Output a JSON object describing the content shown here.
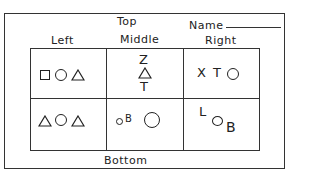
{
  "header": {
    "top_label": "Top",
    "name_label": "Name",
    "bottom_label": "Bottom"
  },
  "columns": [
    "Left",
    "Middle",
    "Right"
  ],
  "cells": {
    "top_left": [
      "square",
      "circle",
      "triangle"
    ],
    "top_middle": [
      "Z",
      "triangle",
      "T"
    ],
    "top_right": [
      "X",
      "T",
      "O"
    ],
    "bottom_left": [
      "triangle",
      "circle",
      "triangle"
    ],
    "bottom_middle": [
      "o",
      "B",
      "large-circle"
    ],
    "bottom_right": [
      "L",
      "O",
      "B"
    ]
  },
  "text": {
    "z": "Z",
    "t": "T",
    "x": "X",
    "t2": "T",
    "b": "B",
    "l": "L",
    "b2": "B"
  }
}
